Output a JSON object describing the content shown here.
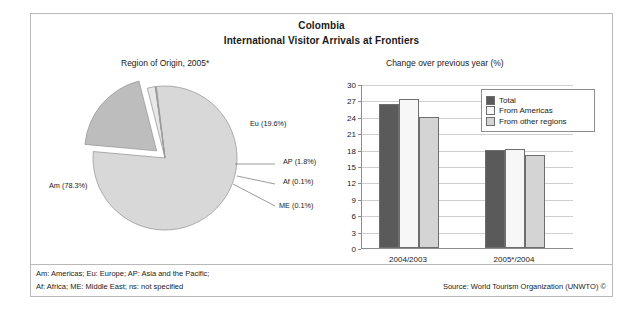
{
  "figure": {
    "title_line1": "Colombia",
    "title_line2": "International Visitor Arrivals at Frontiers",
    "pie_subtitle": "Region of Origin, 2005*",
    "bar_subtitle": "Change over previous year (%)",
    "footnote_line1": "Am: Americas; Eu: Europe; AP: Asia and the Pacific;",
    "footnote_line2": "Af: Africa; ME: Middle East; ns: not specified",
    "source": "Source: World Tourism Organization (UNWTO) ©"
  },
  "colors": {
    "slice_am": "#d8d8d8",
    "slice_eu": "#bdbdbd",
    "slice_ap": "#e8e8e8",
    "slice_af": "#4a4a4a",
    "slice_me": "#f2f2f2",
    "bar_total": "#5a5a5a",
    "bar_americas": "#f7f7f7",
    "bar_other": "#d4d4d4",
    "grid": "#cfcfcf",
    "axis": "#8d8d8d",
    "border": "#b9b9b9"
  },
  "chart_data": [
    {
      "type": "pie",
      "title": "Region of Origin, 2005*",
      "labels": [
        "Am",
        "Eu",
        "AP",
        "Af",
        "ME"
      ],
      "values": [
        78.3,
        19.6,
        1.8,
        0.1,
        0.1
      ],
      "value_suffix": "%",
      "data_labels": [
        "Am (78.3%)",
        "Eu (19.6%)",
        "AP (1.8%)",
        "Af (0.1%)",
        "ME (0.1%)"
      ],
      "exploded": [
        "Eu"
      ],
      "legend": "none",
      "grid": false
    },
    {
      "type": "bar",
      "title": "Change over previous year (%)",
      "xlabel": "",
      "ylabel": "",
      "categories": [
        "2004/2003",
        "2005*/2004"
      ],
      "series": [
        {
          "name": "Total",
          "values": [
            26.4,
            17.9
          ]
        },
        {
          "name": "From Americas",
          "values": [
            27.3,
            18.1
          ]
        },
        {
          "name": "From other regions",
          "values": [
            23.9,
            17.0
          ]
        }
      ],
      "ylim": [
        0,
        30
      ],
      "yticks": [
        0,
        3,
        6,
        9,
        12,
        15,
        18,
        21,
        24,
        27,
        30
      ],
      "grid": true,
      "legend_position": "top-right"
    }
  ]
}
